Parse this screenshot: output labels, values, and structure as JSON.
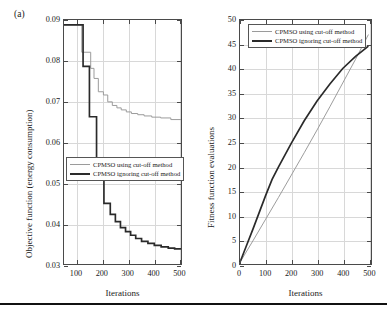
{
  "figure": {
    "panel_tag": "(a)",
    "bottom_rule": true
  },
  "chart_data": [
    {
      "id": "left",
      "type": "line",
      "title": "",
      "panel_label": "(a)",
      "xlabel": "Iterations",
      "ylabel": "Objective function (energy consumption)",
      "xlim": [
        50,
        510
      ],
      "ylim": [
        0.03,
        0.09
      ],
      "xticks": [
        100,
        200,
        300,
        400,
        500
      ],
      "yticks": [
        0.03,
        0.04,
        0.05,
        0.06,
        0.07,
        0.08,
        0.09
      ],
      "xtick_labels": [
        "100",
        "200",
        "300",
        "400",
        "500"
      ],
      "ytick_labels": [
        "0.03",
        "0.04",
        "0.05",
        "0.06",
        "0.07",
        "0.08",
        "0.09"
      ],
      "grid": true,
      "legend_position": "center-left",
      "drawstyle": "steps-post",
      "series": [
        {
          "name": "CPMSO using cut-off method",
          "color": "#9a9a9a",
          "x": [
            50,
            120,
            120,
            155,
            155,
            168,
            168,
            185,
            185,
            205,
            205,
            222,
            222,
            240,
            240,
            258,
            258,
            275,
            275,
            295,
            295,
            315,
            315,
            340,
            340,
            365,
            365,
            395,
            395,
            430,
            430,
            470,
            470,
            510
          ],
          "y": [
            0.0888,
            0.0888,
            0.082,
            0.082,
            0.078,
            0.078,
            0.0755,
            0.0755,
            0.0722,
            0.0722,
            0.0714,
            0.0714,
            0.0697,
            0.0697,
            0.0688,
            0.0688,
            0.0682,
            0.0682,
            0.0677,
            0.0677,
            0.0672,
            0.0672,
            0.0668,
            0.0668,
            0.0665,
            0.0665,
            0.0662,
            0.0662,
            0.0659,
            0.0659,
            0.0657,
            0.0657,
            0.0653,
            0.0653
          ]
        },
        {
          "name": "CPMSO ignoring cut-off method",
          "color": "#2a2a2a",
          "x": [
            50,
            125,
            125,
            150,
            150,
            178,
            178,
            207,
            207,
            232,
            232,
            252,
            252,
            272,
            272,
            292,
            292,
            312,
            312,
            332,
            332,
            355,
            355,
            380,
            380,
            405,
            405,
            432,
            432,
            460,
            460,
            485,
            485,
            510
          ],
          "y": [
            0.0888,
            0.0888,
            0.0785,
            0.0785,
            0.066,
            0.066,
            0.053,
            0.053,
            0.0445,
            0.0445,
            0.0418,
            0.0418,
            0.04,
            0.04,
            0.0385,
            0.0385,
            0.0375,
            0.0375,
            0.0366,
            0.0366,
            0.0358,
            0.0358,
            0.0351,
            0.0351,
            0.0346,
            0.0346,
            0.0341,
            0.0341,
            0.0337,
            0.0337,
            0.0334,
            0.0334,
            0.0332,
            0.0332
          ]
        }
      ]
    },
    {
      "id": "right",
      "type": "line",
      "title": "",
      "xlabel": "Iterations",
      "ylabel": "Fitness function evaluations",
      "xlim": [
        0,
        510
      ],
      "ylim": [
        0,
        50
      ],
      "xticks": [
        0,
        100,
        200,
        300,
        400,
        500
      ],
      "yticks": [
        0,
        5,
        10,
        15,
        20,
        25,
        30,
        35,
        40,
        45,
        50
      ],
      "xtick_labels": [
        "0",
        "100",
        "200",
        "300",
        "400",
        "500"
      ],
      "ytick_labels": [
        "0",
        "5",
        "10",
        "15",
        "20",
        "25",
        "30",
        "35",
        "40",
        "45",
        "50"
      ],
      "grid": true,
      "legend_position": "upper-left",
      "drawstyle": "default",
      "series": [
        {
          "name": "CPMSO using cut-off method",
          "color": "#9a9a9a",
          "x": [
            0,
            50,
            100,
            150,
            200,
            250,
            300,
            350,
            400,
            450,
            500
          ],
          "y": [
            0.0,
            4.4,
            8.9,
            13.4,
            18.0,
            22.6,
            27.3,
            32.1,
            37.0,
            41.9,
            47.0
          ]
        },
        {
          "name": "CPMSO ignoring cut-off method",
          "color": "#2a2a2a",
          "x": [
            0,
            25,
            50,
            75,
            100,
            125,
            150,
            200,
            250,
            300,
            350,
            400,
            450,
            500
          ],
          "y": [
            0.0,
            3.4,
            6.8,
            10.3,
            13.8,
            17.1,
            19.7,
            24.6,
            29.2,
            33.3,
            36.8,
            40.0,
            42.5,
            44.6
          ]
        }
      ]
    }
  ],
  "legend": {
    "entries": [
      {
        "label": "CPMSO using cut-off method",
        "color": "#9a9a9a"
      },
      {
        "label": "CPMSO ignoring cut-off method",
        "color": "#2a2a2a"
      }
    ]
  }
}
